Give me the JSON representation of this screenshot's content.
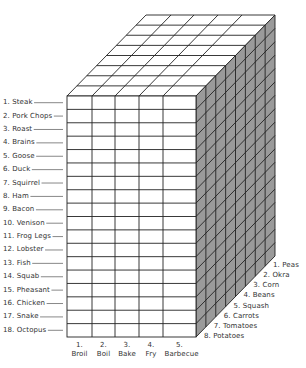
{
  "diagram": {
    "type": "3d-grid-cube",
    "rows_label_side": "left",
    "rows": [
      "1. Steak",
      "2. Pork Chops",
      "3. Roast",
      "4. Brains",
      "5. Goose",
      "6. Duck",
      "7. Squirrel",
      "8. Ham",
      "9. Bacon",
      "10. Venison",
      "11. Frog Legs",
      "12. Lobster",
      "13. Fish",
      "14. Squab",
      "15. Pheasant",
      "16. Chicken",
      "17. Snake",
      "18. Octopus"
    ],
    "columns": [
      {
        "num": "1.",
        "name": "Broil"
      },
      {
        "num": "2.",
        "name": "Boil"
      },
      {
        "num": "3.",
        "name": "Bake"
      },
      {
        "num": "4.",
        "name": "Fry"
      },
      {
        "num": "5.",
        "name": "Barbecue"
      }
    ],
    "depth": [
      "1. Peas",
      "2. Okra",
      "3. Corn",
      "4. Beans",
      "5. Squash",
      "6. Carrots",
      "7. Tomatoes",
      "8. Potatoes"
    ],
    "colors": {
      "line": "#222222",
      "front_face": "#ffffff",
      "top_face": "#ffffff",
      "side_face": "#9a9a9a",
      "text": "#333333"
    }
  }
}
